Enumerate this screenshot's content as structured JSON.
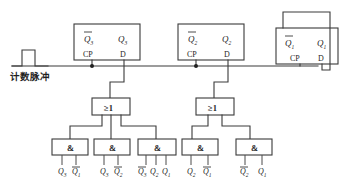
{
  "diagram": {
    "type": "logic-circuit",
    "colors": {
      "wire": "#3a3a3a",
      "text": "#1f1f1f",
      "background": "#ffffff"
    }
  },
  "clock_input": {
    "label": "计数脉冲",
    "waveform": "pulse"
  },
  "flipflops": [
    {
      "id": "ff3",
      "q_bar": "Q",
      "q_bar_sub": "3",
      "q": "Q",
      "q_sub": "3",
      "cp_label": "CP",
      "d_label": "D"
    },
    {
      "id": "ff2",
      "q_bar": "Q",
      "q_bar_sub": "2",
      "q": "Q",
      "q_sub": "2",
      "cp_label": "CP",
      "d_label": "D"
    },
    {
      "id": "ff1",
      "q_bar": "Q",
      "q_bar_sub": "1",
      "q": "Q",
      "q_sub": "1",
      "cp_label": "CP",
      "d_label": "D"
    }
  ],
  "or_gates": [
    {
      "id": "or-left",
      "label": "≥1"
    },
    {
      "id": "or-right",
      "label": "≥1"
    }
  ],
  "and_gates": [
    {
      "id": "and-1",
      "label": "&",
      "inputs": [
        {
          "base": "Q",
          "sub": "3",
          "bar": false
        },
        {
          "base": "Q",
          "sub": "1",
          "bar": true
        }
      ]
    },
    {
      "id": "and-2",
      "label": "&",
      "inputs": [
        {
          "base": "Q",
          "sub": "3",
          "bar": false
        },
        {
          "base": "Q",
          "sub": "2",
          "bar": true
        }
      ]
    },
    {
      "id": "and-3",
      "label": "&",
      "inputs": [
        {
          "base": "Q",
          "sub": "3",
          "bar": true
        },
        {
          "base": "Q",
          "sub": "2",
          "bar": false
        },
        {
          "base": "Q",
          "sub": "1",
          "bar": false
        }
      ]
    },
    {
      "id": "and-4",
      "label": "&",
      "inputs": [
        {
          "base": "Q",
          "sub": "2",
          "bar": false
        },
        {
          "base": "Q",
          "sub": "1",
          "bar": true
        }
      ]
    },
    {
      "id": "and-5",
      "label": "&",
      "inputs": [
        {
          "base": "Q",
          "sub": "2",
          "bar": true
        },
        {
          "base": "Q",
          "sub": "1",
          "bar": false
        }
      ]
    }
  ]
}
